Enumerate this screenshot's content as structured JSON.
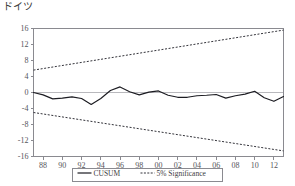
{
  "chart_data": {
    "type": "line",
    "title": "ドイツ",
    "xlabel": "",
    "ylabel": "",
    "ylim": [
      -16,
      16
    ],
    "yticks": [
      16,
      12,
      8,
      4,
      0,
      -4,
      -8,
      -12,
      -16
    ],
    "xticks": [
      "88",
      "90",
      "92",
      "94",
      "96",
      "98",
      "00",
      "02",
      "04",
      "06",
      "08",
      "10",
      "12"
    ],
    "x_start_year": 1987,
    "x_end_year": 2013,
    "grid": false,
    "zero_line": true,
    "legend_position": "bottom-center",
    "legend": [
      {
        "label": "CUSUM",
        "style": "solid",
        "color": "#1c1c22"
      },
      {
        "label": "5% Significance",
        "style": "dashed",
        "color": "#33333a"
      }
    ],
    "series": [
      {
        "name": "CUSUM",
        "style": "solid",
        "color": "#1c1c22",
        "x": [
          1987,
          1988,
          1989,
          1990,
          1991,
          1992,
          1993,
          1994,
          1995,
          1996,
          1997,
          1998,
          1999,
          2000,
          2001,
          2002,
          2003,
          2004,
          2005,
          2006,
          2007,
          2008,
          2009,
          2010,
          2011,
          2012,
          2013
        ],
        "values": [
          0.0,
          -0.6,
          -1.6,
          -1.4,
          -1.1,
          -1.5,
          -3.0,
          -1.5,
          0.5,
          1.4,
          0.2,
          -0.6,
          0.1,
          0.4,
          -0.7,
          -1.2,
          -1.2,
          -0.8,
          -0.7,
          -0.5,
          -1.4,
          -0.8,
          -0.4,
          0.3,
          -1.3,
          -2.2,
          -1.0
        ]
      },
      {
        "name": "5% Significance Upper",
        "style": "dashed",
        "color": "#33333a",
        "x": [
          1987,
          2013
        ],
        "values": [
          5.6,
          15.6
        ]
      },
      {
        "name": "5% Significance Lower",
        "style": "dashed",
        "color": "#33333a",
        "x": [
          1987,
          2013
        ],
        "values": [
          -5.0,
          -14.6
        ]
      }
    ]
  }
}
